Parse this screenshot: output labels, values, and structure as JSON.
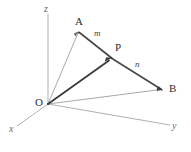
{
  "figure": {
    "background_color": "#ffffff"
  },
  "axes": {
    "z": {
      "label": "z",
      "from": [
        48,
        104
      ],
      "to": [
        48,
        14
      ]
    },
    "x": {
      "label": "x",
      "from": [
        48,
        104
      ],
      "to": [
        17,
        126
      ]
    },
    "y": {
      "label": "y",
      "from": [
        48,
        104
      ],
      "to": [
        170,
        125
      ]
    }
  },
  "points": {
    "O": {
      "label": "O",
      "x": 48,
      "y": 104
    },
    "A": {
      "label": "A",
      "x": 79,
      "y": 32
    },
    "P": {
      "label": "P",
      "x": 112,
      "y": 58
    },
    "B": {
      "label": "B",
      "x": 162,
      "y": 90
    }
  },
  "segments": {
    "m": {
      "label": "m",
      "from": "A",
      "to": "P"
    },
    "n": {
      "label": "n",
      "from": "P",
      "to": "B"
    }
  },
  "vectors": {
    "OA": {
      "from": "O",
      "to": "A",
      "style": "thin"
    },
    "OP": {
      "from": "O",
      "to": "P",
      "style": "thick"
    },
    "OB": {
      "from": "O",
      "to": "B",
      "style": "thin"
    }
  },
  "colors": {
    "axis": "#9a9a9a",
    "thin_vector": "#9e9e9e",
    "thick_vector": "#3a3a3a",
    "segment": "#4a4a4a",
    "label": "#2e2e2e"
  }
}
